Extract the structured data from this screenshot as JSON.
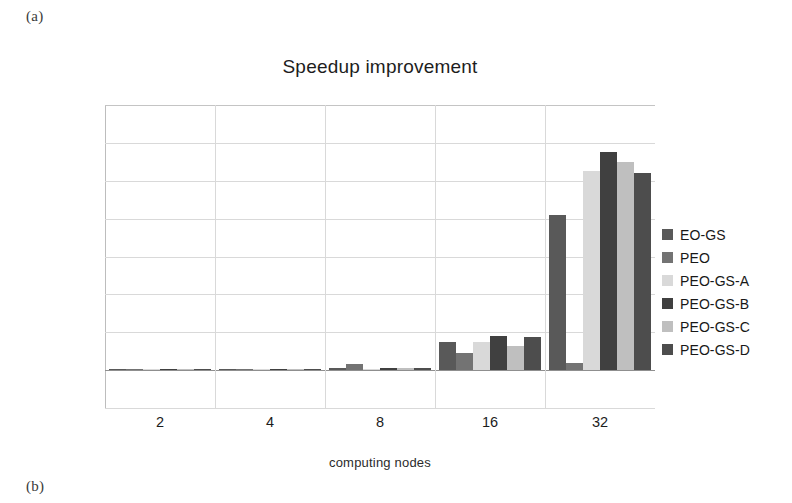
{
  "figure": {
    "panel_a_label": "(a)",
    "panel_b_label": "(b)"
  },
  "chart_data": {
    "type": "bar",
    "title": "Speedup improvement",
    "xlabel": "computing nodes",
    "ylabel": "",
    "categories": [
      "2",
      "4",
      "8",
      "16",
      "32"
    ],
    "ylim": [
      -2,
      14
    ],
    "ytick_values": [
      14,
      12,
      10,
      8,
      6,
      4,
      2,
      0,
      -2
    ],
    "ytick_labels": [
      "14,00%",
      "12,00%",
      "10,00%",
      "8,00%",
      "6,00%",
      "4,00%",
      "2,00%",
      "0,00%",
      "-2,00%"
    ],
    "grid": true,
    "legend_position": "right",
    "value_unit": "%",
    "series": [
      {
        "name": "EO-GS",
        "color": "#595959",
        "values": [
          0.03,
          0.05,
          0.1,
          1.5,
          8.2
        ]
      },
      {
        "name": "PEO",
        "color": "#737373",
        "values": [
          0.02,
          0.04,
          0.33,
          0.9,
          0.4
        ]
      },
      {
        "name": "PEO-GS-A",
        "color": "#d9d9d9",
        "values": [
          0.02,
          0.05,
          0.08,
          1.5,
          10.5
        ]
      },
      {
        "name": "PEO-GS-B",
        "color": "#404040",
        "values": [
          0.03,
          0.06,
          0.12,
          1.8,
          11.5
        ]
      },
      {
        "name": "PEO-GS-C",
        "color": "#bfbfbf",
        "values": [
          0.02,
          0.04,
          0.09,
          1.25,
          11.0
        ]
      },
      {
        "name": "PEO-GS-D",
        "color": "#4d4d4d",
        "values": [
          0.03,
          0.05,
          0.11,
          1.75,
          10.4
        ]
      }
    ]
  }
}
